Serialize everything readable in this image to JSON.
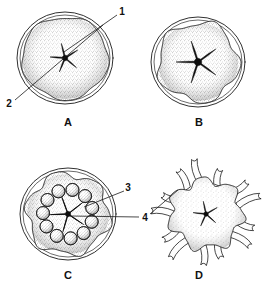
{
  "figure": {
    "background_color": "#ffffff",
    "ink_color": "#1a1a1a",
    "stipple_color": "#8a8a8a"
  },
  "panels": [
    {
      "id": "A",
      "caption": "A",
      "caption_x": 68,
      "caption_y": 126,
      "description": "Spherical embryo enclosed by fertilization membrane with dark star-shaped internal cavity",
      "center_x": 65,
      "center_y": 58,
      "outer_membrane_rx": 48,
      "outer_membrane_ry": 46,
      "body_rx": 43,
      "body_ry": 41,
      "star_arms": 5,
      "star_outer_radius": 15,
      "star_inner_radius": 3,
      "star_rotation": -14
    },
    {
      "id": "B",
      "caption": "B",
      "caption_x": 199,
      "caption_y": 126,
      "description": "Lobed embryo with prominent five-armed star-shaped cavity",
      "center_x": 198,
      "center_y": 62,
      "outer_membrane_rx": 47,
      "outer_membrane_ry": 45,
      "body_rx": 40,
      "body_ry": 39,
      "star_arms": 5,
      "star_outer_radius": 22,
      "star_inner_radius": 4,
      "star_rotation": -18
    },
    {
      "id": "C",
      "caption": "C",
      "caption_x": 68,
      "caption_y": 279,
      "description": "Lobed body with a ring of rounded vesicles encircling the central star",
      "center_x": 68,
      "center_y": 214,
      "outer_membrane_rx": 48,
      "outer_membrane_ry": 46,
      "body_rx": 41,
      "body_ry": 40,
      "star_arms": 5,
      "star_outer_radius": 17,
      "star_inner_radius": 3,
      "star_rotation": -20,
      "vesicle_count": 11,
      "vesicle_ring_radius": 25,
      "vesicle_radius": 6.5
    },
    {
      "id": "D",
      "caption": "D",
      "caption_x": 199,
      "caption_y": 279,
      "description": "Irregular lobed body bearing numerous tube-foot projections radiating outward",
      "center_x": 206,
      "center_y": 214,
      "body_rx": 40,
      "body_ry": 38,
      "star_arms": 5,
      "star_outer_radius": 13,
      "star_inner_radius": 2.5,
      "star_rotation": -12,
      "podia_count": 13
    }
  ],
  "reference_numbers": [
    {
      "label": "1",
      "x": 122,
      "y": 12,
      "points_to_panel": "A",
      "leader": "from label down-left to the dark star-shaped cavity at the centre of embryo A"
    },
    {
      "label": "2",
      "x": 9,
      "y": 104,
      "points_to_panel": "A",
      "leader": "from label up-right across the embryo to the outer fertilization membrane of A"
    },
    {
      "label": "3",
      "x": 128,
      "y": 188,
      "points_to_panel": "C",
      "leader": "from label down-left to one of the rounded vesicles in the ring of embryo C"
    },
    {
      "label": "4",
      "x": 145,
      "y": 218,
      "points_to_panel": "C and D",
      "leader": "horizontal line left into the centre of C, and a line up-right to a tube foot of D"
    }
  ]
}
